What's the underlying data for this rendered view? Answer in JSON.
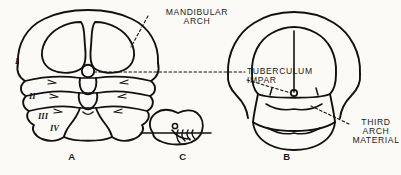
{
  "figure": {
    "background_color": "#fbfaf7",
    "ink_color": "#111111",
    "annotations": [
      {
        "id": "mandibular",
        "text": "MANDIBULAR\nARCH",
        "points_to": "figure-a-right-arch"
      },
      {
        "id": "tuberculum",
        "text": "TUBERCULUM\nIMPAR",
        "points_to": "figure-a-median-swelling"
      },
      {
        "id": "third_arch",
        "text": "THIRD\nARCH\nMATERIAL",
        "points_to": "figure-b-lower-region"
      }
    ],
    "panels": [
      {
        "id": "a",
        "letter": "A",
        "caption": "A"
      },
      {
        "id": "c",
        "letter": "C",
        "caption": "C"
      },
      {
        "id": "b",
        "letter": "B",
        "caption": "B"
      }
    ],
    "arch_numerals": [
      {
        "id": "arch1",
        "text": "I"
      },
      {
        "id": "arch2",
        "text": "II"
      },
      {
        "id": "arch3",
        "text": "III"
      },
      {
        "id": "arch4",
        "text": "IV"
      }
    ]
  }
}
